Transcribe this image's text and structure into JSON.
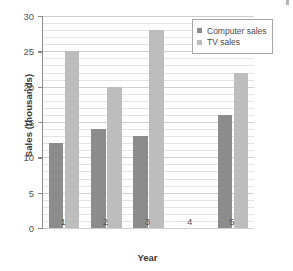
{
  "chart_data": {
    "type": "bar",
    "title": "",
    "xlabel": "Year",
    "ylabel": "Sales (thousands)",
    "categories": [
      "1",
      "2",
      "3",
      "4",
      "5"
    ],
    "series": [
      {
        "name": "Computer sales",
        "color": "#8c8c8c",
        "values": [
          12,
          14,
          13,
          0,
          16
        ]
      },
      {
        "name": "TV sales",
        "color": "#bdbdbd",
        "values": [
          25,
          20,
          28,
          0,
          22
        ]
      }
    ],
    "ylim": [
      0,
      30
    ],
    "ytick_step": 5,
    "yticks": [
      "0",
      "5",
      "10",
      "15",
      "20",
      "25",
      "30"
    ],
    "minor_gridline_step": 1,
    "grid": true,
    "legend_position": "top-right"
  },
  "legend": {
    "items": [
      {
        "label": "Computer sales",
        "color": "#8c8c8c"
      },
      {
        "label": "TV sales",
        "color": "#bdbdbd"
      }
    ]
  },
  "axes": {
    "x_title": "Year",
    "y_title": "Sales (thousands)"
  }
}
